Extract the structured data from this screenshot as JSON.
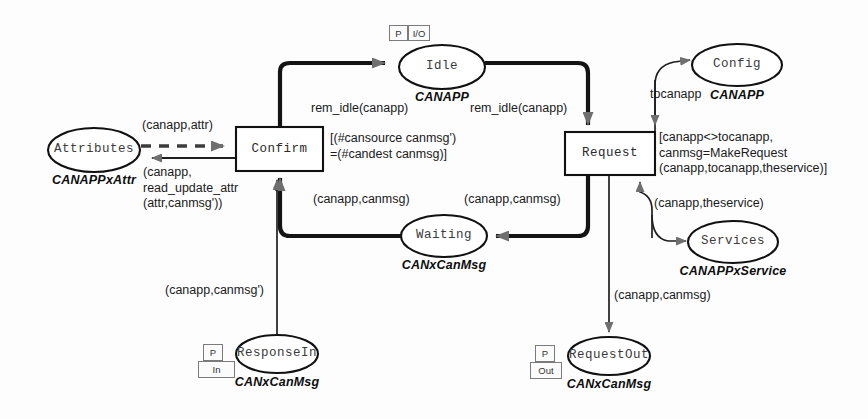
{
  "diagram": {
    "kind": "coloured-petri-net",
    "places": [
      {
        "id": "attributes",
        "name": "Attributes",
        "colourset": "CANAPPxAttr",
        "port": null,
        "cx": 94,
        "cy": 150,
        "rx": 46,
        "ry": 22,
        "csx": 94,
        "csy": 180
      },
      {
        "id": "idle",
        "name": "Idle",
        "colourset": "CANAPP",
        "port": {
          "p": "P",
          "dir": "I/O",
          "layout": "side"
        },
        "cx": 442,
        "cy": 67,
        "rx": 43,
        "ry": 22,
        "csx": 442,
        "csy": 97
      },
      {
        "id": "config",
        "name": "Config",
        "colourset": "CANAPP",
        "port": null,
        "cx": 737,
        "cy": 65,
        "rx": 45,
        "ry": 21,
        "csx": 737,
        "csy": 95
      },
      {
        "id": "waiting",
        "name": "Waiting",
        "colourset": "CANxCanMsg",
        "port": null,
        "cx": 444,
        "cy": 236,
        "rx": 43,
        "ry": 21,
        "csx": 444,
        "csy": 265
      },
      {
        "id": "services",
        "name": "Services",
        "colourset": "CANAPPxService",
        "port": null,
        "cx": 733,
        "cy": 242,
        "rx": 45,
        "ry": 21,
        "csx": 733,
        "csy": 271
      },
      {
        "id": "responsein",
        "name": "ResponseIn",
        "colourset": "CANxCanMsg",
        "port": {
          "p": "P",
          "dir": "In",
          "layout": "stack"
        },
        "cx": 277,
        "cy": 354,
        "rx": 41,
        "ry": 19,
        "csx": 277,
        "csy": 382
      },
      {
        "id": "requestout",
        "name": "RequestOut",
        "colourset": "CANxCanMsg",
        "port": {
          "p": "P",
          "dir": "Out",
          "layout": "stack"
        },
        "cx": 609,
        "cy": 356,
        "rx": 41,
        "ry": 19,
        "csx": 609,
        "csy": 384
      }
    ],
    "transitions": [
      {
        "id": "confirm",
        "name": "Confirm",
        "x": 236,
        "y": 127,
        "w": 87,
        "h": 44,
        "guard": "[(#cansource canmsg')\n=(#candest canmsg)]",
        "gx": 330,
        "gy": 131
      },
      {
        "id": "request",
        "name": "Request",
        "x": 565,
        "y": 132,
        "w": 90,
        "h": 43,
        "guard": "[canapp<>tocanapp,\ncanmsg=MakeRequest\n(canapp,tocanapp,theservice)]",
        "gx": 659,
        "gy": 130
      }
    ],
    "arcs": [
      {
        "id": "confirm-to-idle",
        "from": "confirm",
        "to": "idle",
        "style": "thick",
        "inscription": "rem_idle(canapp)",
        "lx": 311,
        "ly": 101
      },
      {
        "id": "idle-to-request",
        "from": "idle",
        "to": "request",
        "style": "thick",
        "inscription": "rem_idle(canapp)",
        "lx": 470,
        "ly": 101
      },
      {
        "id": "request-to-waiting",
        "from": "request",
        "to": "waiting",
        "style": "thick",
        "inscription": "(canapp,canmsg)",
        "lx": 464,
        "ly": 192
      },
      {
        "id": "waiting-to-confirm",
        "from": "waiting",
        "to": "confirm",
        "style": "thick",
        "inscription": "(canapp,canmsg)",
        "lx": 313,
        "ly": 192
      },
      {
        "id": "attributes-to-confirm",
        "from": "attributes",
        "to": "confirm",
        "style": "dashed",
        "inscription": "(canapp,attr)",
        "lx": 142,
        "ly": 118
      },
      {
        "id": "confirm-to-attributes",
        "from": "confirm",
        "to": "attributes",
        "style": "thin",
        "inscription": "(canapp,\nread_update_attr\n(attr,canmsg'))",
        "lx": 143,
        "ly": 165
      },
      {
        "id": "responsein-to-confirm",
        "from": "responsein",
        "to": "confirm",
        "style": "thin",
        "inscription": "(canapp,canmsg')",
        "lx": 165,
        "ly": 283
      },
      {
        "id": "request-to-config",
        "from": "request",
        "to": "config",
        "style": "thin",
        "inscription": "tocanapp",
        "lx": 650,
        "ly": 87
      },
      {
        "id": "services-to-request",
        "from": "services",
        "to": "request",
        "style": "thin",
        "inscription": "(canapp,theservice)",
        "lx": 654,
        "ly": 196
      },
      {
        "id": "request-to-requestout",
        "from": "request",
        "to": "requestout",
        "style": "thin",
        "inscription": "(canapp,canmsg)",
        "lx": 614,
        "ly": 288
      }
    ],
    "colors": {
      "ink": "#111111",
      "arc": "#1a1a1a",
      "arrowhead": "#707070",
      "nodeline": "#111111",
      "tagborder": "#7b7b7b"
    }
  }
}
